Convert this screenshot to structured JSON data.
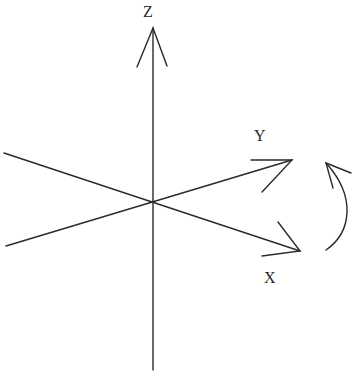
{
  "diagram": {
    "type": "coordinate-axes",
    "colors": {
      "stroke": "#2a2a2a",
      "background": "#ffffff"
    },
    "origin": [
      153,
      202
    ],
    "axes": [
      {
        "label": "Z",
        "label_pos": [
          143,
          4
        ],
        "from": [
          153,
          370
        ],
        "to": [
          153,
          28
        ]
      },
      {
        "label": "Y",
        "label_pos": [
          254,
          128
        ],
        "from": [
          6,
          246
        ],
        "to": [
          292,
          160
        ]
      },
      {
        "label": "X",
        "label_pos": [
          264,
          270
        ],
        "from": [
          4,
          153
        ],
        "to": [
          300,
          251
        ]
      }
    ],
    "rotation_arrow": {
      "direction": "counter-clockwise",
      "about": "Z"
    }
  }
}
